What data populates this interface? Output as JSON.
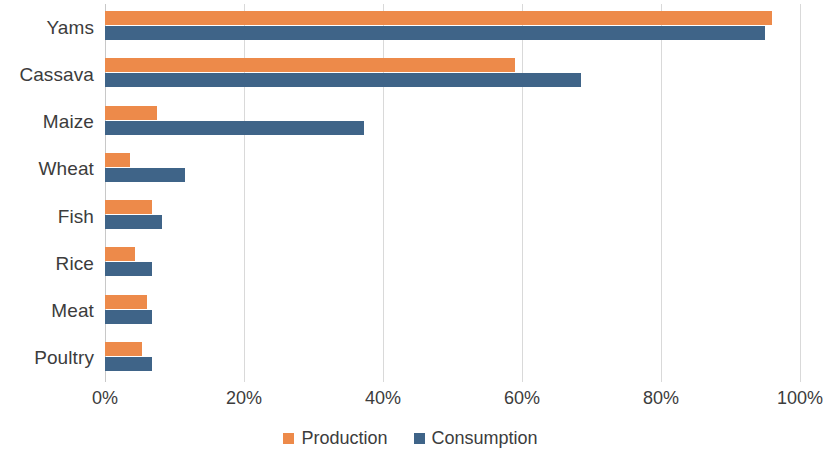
{
  "chart_data": {
    "type": "bar",
    "orientation": "horizontal",
    "title": "",
    "subtitle": "",
    "xlabel": "",
    "ylabel": "",
    "categories": [
      "Yams",
      "Cassava",
      "Maize",
      "Wheat",
      "Fish",
      "Rice",
      "Meat",
      "Poultry"
    ],
    "series": [
      {
        "name": "Production",
        "color": "#ED8A4A",
        "values": [
          96,
          59,
          7.5,
          3.6,
          6.7,
          4.3,
          6.0,
          5.3
        ]
      },
      {
        "name": "Consumption",
        "color": "#3F6488",
        "values": [
          95,
          68.5,
          37.3,
          11.5,
          8.2,
          6.7,
          6.7,
          6.7
        ]
      }
    ],
    "xlim": [
      0,
      100
    ],
    "xticks": [
      0,
      20,
      40,
      60,
      80,
      100
    ],
    "xtick_labels": [
      "0%",
      "20%",
      "40%",
      "60%",
      "80%",
      "100%"
    ],
    "grid": true,
    "grid_axis": "x",
    "legend_position": "bottom",
    "value_suffix": "%",
    "gridline_color": "#D9D9D9",
    "axis_color": "#C8C8C8",
    "background": "#FFFFFF"
  },
  "legend": {
    "items": [
      {
        "label": "Production",
        "color": "#ED8A4A"
      },
      {
        "label": "Consumption",
        "color": "#3F6488"
      }
    ]
  }
}
